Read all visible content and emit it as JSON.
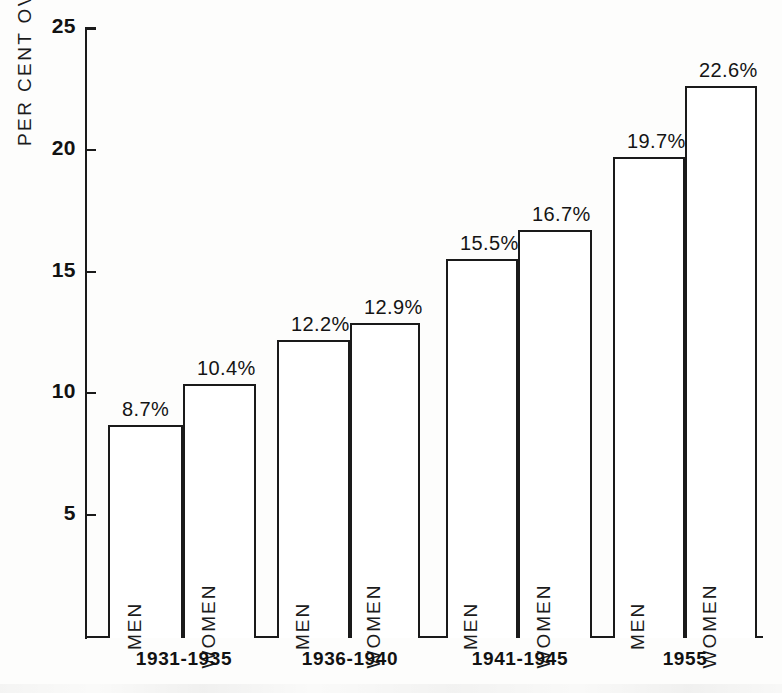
{
  "chart_data": {
    "type": "bar",
    "title": "",
    "xlabel": "",
    "ylabel": "PER CENT OVER 60 YEARS",
    "ylim": [
      0,
      25
    ],
    "yticks": [
      5,
      10,
      15,
      20,
      25
    ],
    "ytick_labels": [
      "5",
      "10",
      "15",
      "20",
      "25"
    ],
    "grid": false,
    "legend": "none",
    "categories": [
      "1931-1935",
      "1936-1940",
      "1941-1945",
      "1955"
    ],
    "series": [
      {
        "name": "MEN",
        "values": [
          8.7,
          12.2,
          15.5,
          19.7
        ]
      },
      {
        "name": "WOMEN",
        "values": [
          10.4,
          12.9,
          16.7,
          22.6
        ]
      }
    ],
    "bars": [
      {
        "group": "1931-1935",
        "series": "MEN",
        "value": 8.7,
        "data_label": "8.7%",
        "x": 108,
        "width": 75
      },
      {
        "group": "1931-1935",
        "series": "WOMEN",
        "value": 10.4,
        "data_label": "10.4%",
        "x": 183,
        "width": 73
      },
      {
        "group": "1936-1940",
        "series": "MEN",
        "value": 12.2,
        "data_label": "12.2%",
        "x": 277,
        "width": 73
      },
      {
        "group": "1936-1940",
        "series": "WOMEN",
        "value": 12.9,
        "data_label": "12.9%",
        "x": 350,
        "width": 70
      },
      {
        "group": "1941-1945",
        "series": "MEN",
        "value": 15.5,
        "data_label": "15.5%",
        "x": 446,
        "width": 72
      },
      {
        "group": "1941-1945",
        "series": "WOMEN",
        "value": 16.7,
        "data_label": "16.7%",
        "x": 518,
        "width": 74
      },
      {
        "group": "1955",
        "series": "MEN",
        "value": 19.7,
        "data_label": "19.7%",
        "x": 613,
        "width": 72
      },
      {
        "group": "1955",
        "series": "WOMEN",
        "value": 22.6,
        "data_label": "22.6%",
        "x": 685,
        "width": 72
      }
    ],
    "category_label_positions": [
      {
        "label": "1931-1935",
        "center": 184
      },
      {
        "label": "1936-1940",
        "center": 350
      },
      {
        "label": "1941-1945",
        "center": 520
      },
      {
        "label": "1955",
        "center": 685
      }
    ],
    "colors": {
      "bar_fill": "#ffffff",
      "bar_outline": "#1a1a1a",
      "axis": "#1a1a1a",
      "text": "#141414",
      "background": "#fdfdfc"
    }
  }
}
